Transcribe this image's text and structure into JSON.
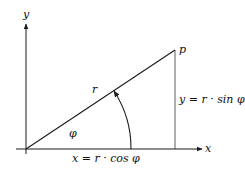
{
  "diagram": {
    "axis_x_label": "x",
    "axis_y_label": "y",
    "point_label": "p",
    "radius_label": "r",
    "angle_label": "φ",
    "x_formula": "x = r · cos φ",
    "y_formula": "y = r · sin φ",
    "stroke_color": "#1a1a1a"
  }
}
